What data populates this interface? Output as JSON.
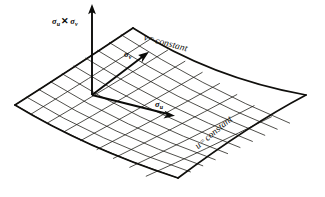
{
  "figure": {
    "background_color": "#ffffff",
    "ink_color": "#0a0a08",
    "width": 325,
    "height": 197
  },
  "labels": {
    "normal_vector": {
      "sigma_first": "σ",
      "sub_first": "u",
      "cross": "✕",
      "sigma_second": "σ",
      "sub_second": "v",
      "plain": "σu ✕ σv"
    },
    "tangent_v": {
      "sigma": "σ",
      "sub": "v",
      "plain": "σv"
    },
    "tangent_u": {
      "sigma": "σ",
      "sub": "u",
      "plain": "σu"
    },
    "curve_v_constant": {
      "variable": "v",
      "equals": "=",
      "value": "constant",
      "plain": "v = constant"
    },
    "curve_u_constant": {
      "variable": "u",
      "equals": "=",
      "value": "constant",
      "plain": "u = constant"
    }
  },
  "geometry": {
    "surface_corners": {
      "top": [
        133,
        28
      ],
      "left": [
        15,
        105
      ],
      "bottom": [
        178,
        178
      ],
      "right": [
        306,
        95
      ]
    },
    "grid_divisions_u": 10,
    "grid_divisions_v": 10,
    "origin_point": [
      92,
      95
    ],
    "normal_arrow_tip": [
      92,
      5
    ],
    "tangent_v_arrow_tip": [
      148,
      52
    ],
    "tangent_u_arrow_tip": [
      174,
      117
    ]
  }
}
